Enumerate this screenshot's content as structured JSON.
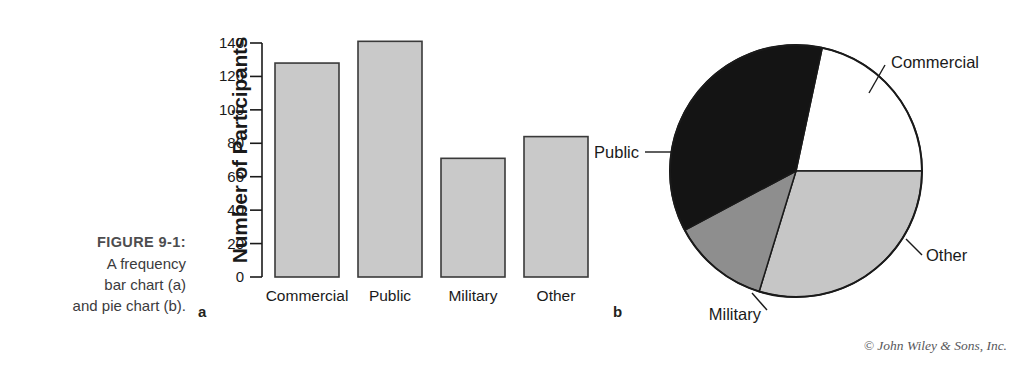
{
  "figure": {
    "number_label": "FIGURE 9-1:",
    "caption_line_1": "A frequency",
    "caption_line_2": "bar chart (a)",
    "caption_line_3": "and pie chart (b).",
    "panel_a_letter": "a",
    "panel_b_letter": "b",
    "credit": "© John Wiley & Sons, Inc."
  },
  "chart_data": [
    {
      "type": "bar",
      "panel": "a",
      "title": "",
      "xlabel": "",
      "ylabel": "Number of Participants",
      "categories": [
        "Commercial",
        "Public",
        "Military",
        "Other"
      ],
      "values": [
        128,
        141,
        71,
        84
      ],
      "ylim": [
        0,
        140
      ],
      "yticks": [
        0,
        20,
        40,
        60,
        80,
        100,
        120,
        140
      ],
      "ytick_labels": [
        "0",
        "20",
        "40",
        "60",
        "80",
        "100",
        "120",
        "140"
      ],
      "grid": false,
      "legend": "none",
      "bar_fill_color": "#c9c9c9",
      "bar_edge_color": "#3a3a3a",
      "axis_color": "#1a1a1a"
    },
    {
      "type": "pie",
      "panel": "b",
      "title": "",
      "labels": [
        "Commercial",
        "Public",
        "Military",
        "Other"
      ],
      "values": [
        128,
        141,
        71,
        84
      ],
      "percentages": [
        29.6,
        32.6,
        16.4,
        19.4
      ],
      "slice_colors": [
        "#ffffff",
        "#141414",
        "#8e8e8e",
        "#c6c6c6"
      ],
      "outline_color": "#1a1a1a",
      "legend": "callout-labels",
      "label_positions": [
        "right-top",
        "left",
        "bottom-left",
        "right-bottom"
      ]
    }
  ]
}
